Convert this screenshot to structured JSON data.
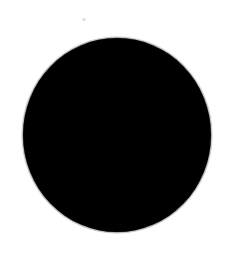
{
  "image": {
    "width": 227,
    "height": 253,
    "background_color": "#ffffff",
    "description": "A single large solid black filled circle centered on a plain white background, with soft anti-aliased edges typical of a scanned image."
  },
  "shapes": {
    "disc": {
      "name": "black-disc",
      "type": "circle",
      "fill_color": "#000000",
      "left": 23,
      "top": 38,
      "width": 188,
      "height": 194,
      "center_x": 117,
      "center_y": 135,
      "radius": 95
    },
    "halo": {
      "name": "disc-edge-halo",
      "type": "ring",
      "color": "#787878",
      "opacity": 0.3
    },
    "speck": {
      "name": "dust-speck-artifact",
      "type": "circle",
      "fill_color": "#969696",
      "opacity": 0.3,
      "left": 82,
      "top": 18,
      "width": 4,
      "height": 3
    }
  },
  "text": {
    "alt": "Solid black circle on white background"
  }
}
